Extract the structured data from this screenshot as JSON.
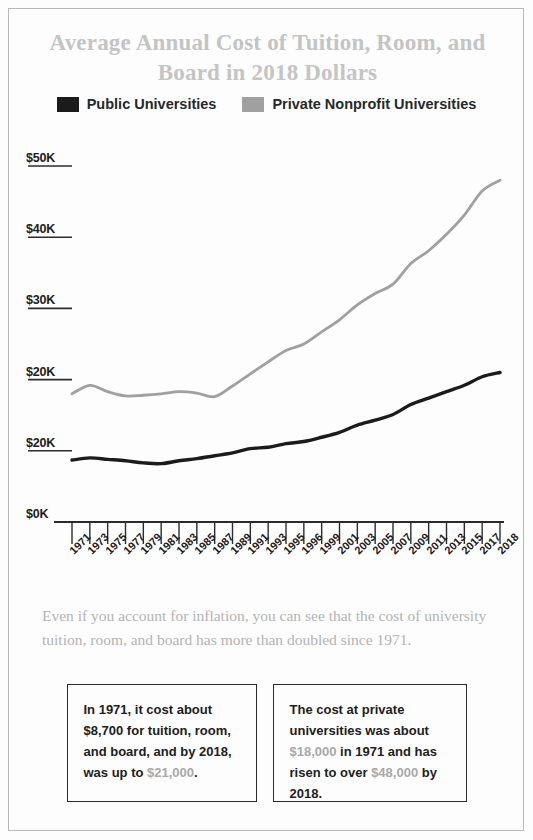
{
  "title": "Average Annual Cost of Tuition, Room, and Board in 2018 Dollars",
  "colors": {
    "public": "#1b1b1b",
    "private": "#a0a0a0",
    "title": "#c4c4c4",
    "caption": "#b3b3b3",
    "accent": "#a8a8a8",
    "border": "#b9b9b9",
    "axis": "#2b2b2b"
  },
  "legend": {
    "items": [
      {
        "label": "Public Universities",
        "color": "#1b1b1b",
        "swatch": "public-swatch"
      },
      {
        "label": "Private Nonprofit Universities",
        "color": "#a0a0a0",
        "swatch": "private-swatch"
      }
    ]
  },
  "caption": "Even if you account for inflation, you can see that the cost of university tuition, room, and board has more than doubled since 1971.",
  "callouts": [
    {
      "name": "public-callout",
      "parts": [
        {
          "text": "In 1971, it cost about $8,700 for tuition, room, and board, and by 2018, was up to ",
          "accent": false
        },
        {
          "text": "$21,000",
          "accent": true
        },
        {
          "text": ".",
          "accent": false
        }
      ],
      "full_text": "In 1971, it cost about $8,700 for tuition, room, and board, and by 2018, was up to $21,000."
    },
    {
      "name": "private-callout",
      "parts": [
        {
          "text": "The cost at private universities was about ",
          "accent": false
        },
        {
          "text": "$18,000",
          "accent": true
        },
        {
          "text": " in 1971 and has risen to over ",
          "accent": false
        },
        {
          "text": "$48,000",
          "accent": true
        },
        {
          "text": " by 2018.",
          "accent": false
        }
      ],
      "full_text": "The cost at private universities was about $18,000 in 1971 and has risen to over $48,000 by 2018."
    }
  ],
  "chart_data": {
    "type": "line",
    "title": "Average Annual Cost of Tuition, Room, and Board in 2018 Dollars",
    "xlabel": "",
    "ylabel": "",
    "grid": false,
    "legend_position": "top-center",
    "ylim": [
      0,
      50000
    ],
    "ytick_labels": [
      "$0K",
      "$20K",
      "$20K",
      "$30K",
      "$40K",
      "$50K"
    ],
    "ytick_values": [
      0,
      10000,
      20000,
      30000,
      40000,
      50000
    ],
    "categories": [
      "1971",
      "1973",
      "1975",
      "1977",
      "1979",
      "1981",
      "1983",
      "1985",
      "1987",
      "1989",
      "1991",
      "1993",
      "1995",
      "1996",
      "1999",
      "2001",
      "2003",
      "2005",
      "2007",
      "2009",
      "2011",
      "2013",
      "2015",
      "2017",
      "2018"
    ],
    "series": [
      {
        "name": "Public Universities",
        "color": "#1b1b1b",
        "values": [
          8700,
          9000,
          8800,
          8600,
          8300,
          8200,
          8600,
          8900,
          9300,
          9700,
          10300,
          10500,
          11000,
          11300,
          11900,
          12600,
          13600,
          14300,
          15100,
          16500,
          17400,
          18300,
          19200,
          20400,
          21000
        ]
      },
      {
        "name": "Private Nonprofit Universities",
        "color": "#a0a0a0",
        "values": [
          18000,
          19200,
          18300,
          17700,
          17800,
          18000,
          18300,
          18100,
          17600,
          19100,
          20800,
          22500,
          24100,
          25000,
          26700,
          28400,
          30500,
          32100,
          33400,
          36300,
          38100,
          40400,
          43100,
          46500,
          48000
        ]
      }
    ],
    "annotations": [
      "In 1971, it cost about $8,700 for tuition, room, and board, and by 2018, was up to $21,000.",
      "The cost at private universities was about $18,000 in 1971 and has risen to over $48,000 by 2018."
    ]
  }
}
